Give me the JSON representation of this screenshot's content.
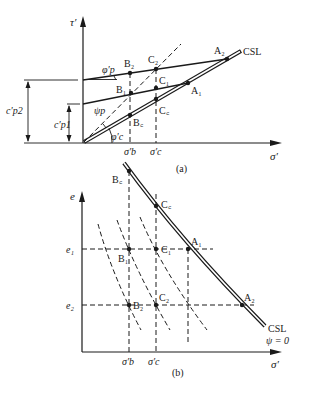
{
  "figure": {
    "panel_a": {
      "caption": "(a)",
      "y_axis_label": "τ′",
      "x_axis_label": "σ′",
      "csl_label": "CSL",
      "points": [
        {
          "id": "A2",
          "label": "A₂"
        },
        {
          "id": "A1",
          "label": "A₁"
        },
        {
          "id": "B2",
          "label": "B₂"
        },
        {
          "id": "B1",
          "label": "B₁"
        },
        {
          "id": "Bc",
          "label": "B꜀"
        },
        {
          "id": "C2",
          "label": "C₂"
        },
        {
          "id": "C1",
          "label": "C₁"
        },
        {
          "id": "Cc",
          "label": "C꜀"
        }
      ],
      "angles": {
        "phi_p": "φ′p",
        "psi_p": "ψp",
        "phi_c": "φ′c"
      },
      "intercepts": {
        "c_p2": "c′p2",
        "c_p1": "c′p1"
      },
      "x_ticks": {
        "sigma_b": "σ′b",
        "sigma_c": "σ′c"
      }
    },
    "panel_b": {
      "caption": "(b)",
      "y_axis_label": "e",
      "x_axis_label": "σ′",
      "csl_label": "CSL",
      "csl_sublabel": "ψ = 0",
      "y_ticks": {
        "e1": "e₁",
        "e2": "e₂"
      },
      "x_ticks": {
        "sigma_b": "σ′b",
        "sigma_c": "σ′c"
      },
      "points": [
        {
          "id": "Bc",
          "label": "B꜀"
        },
        {
          "id": "Cc",
          "label": "C꜀"
        },
        {
          "id": "B1",
          "label": "B₁"
        },
        {
          "id": "C1",
          "label": "C₁"
        },
        {
          "id": "A1",
          "label": "A₁"
        },
        {
          "id": "B2",
          "label": "B₂"
        },
        {
          "id": "C2",
          "label": "C₂"
        },
        {
          "id": "A2",
          "label": "A₂"
        }
      ]
    }
  }
}
